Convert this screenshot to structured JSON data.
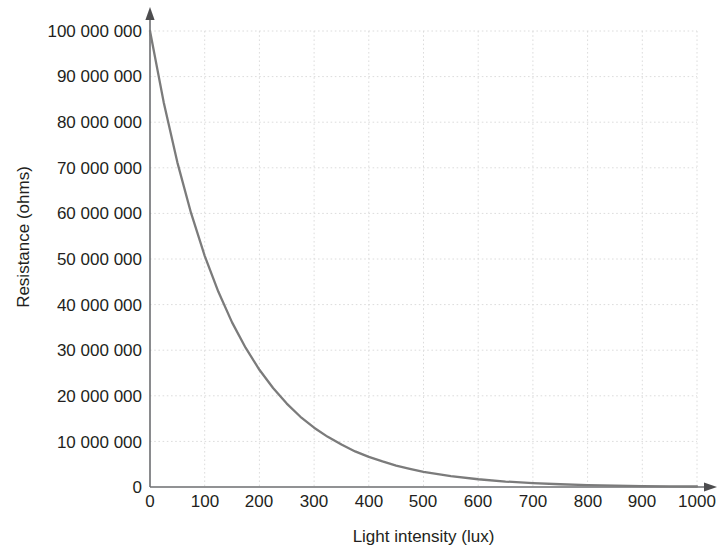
{
  "chart_data": {
    "type": "line",
    "title": "",
    "xlabel": "Light intensity (lux)",
    "ylabel": "Resistance (ohms)",
    "xlim": [
      0,
      1000
    ],
    "ylim": [
      0,
      100000000
    ],
    "grid": true,
    "legend": "none",
    "xticks": [
      0,
      100,
      200,
      300,
      400,
      500,
      600,
      700,
      800,
      900,
      1000
    ],
    "xtick_labels": [
      "0",
      "100",
      "200",
      "300",
      "400",
      "500",
      "600",
      "700",
      "800",
      "900",
      "1000"
    ],
    "yticks": [
      0,
      10000000,
      20000000,
      30000000,
      40000000,
      50000000,
      60000000,
      70000000,
      80000000,
      90000000,
      100000000
    ],
    "ytick_labels": [
      "0",
      "10 000 000",
      "20 000 000",
      "30 000 000",
      "40 000 000",
      "50 000 000",
      "60 000 000",
      "70 000 000",
      "80 000 000",
      "90 000 000",
      "100 000 000"
    ],
    "series": [
      {
        "name": "Resistance vs light intensity",
        "color": "#7b7b7b",
        "x": [
          0,
          25,
          50,
          75,
          100,
          125,
          150,
          175,
          200,
          225,
          250,
          275,
          300,
          325,
          350,
          375,
          400,
          425,
          450,
          475,
          500,
          550,
          600,
          650,
          700,
          750,
          800,
          850,
          900,
          950,
          1000
        ],
        "y": [
          100000000,
          84400000,
          71200000,
          60100000,
          50700000,
          42800000,
          36100000,
          30500000,
          25700000,
          21700000,
          18300000,
          15400000,
          13000000,
          11000000,
          9300000,
          7800000,
          6600000,
          5600000,
          4700000,
          4000000,
          3300000,
          2400000,
          1700000,
          1200000,
          850000,
          600000,
          430000,
          300000,
          210000,
          150000,
          110000
        ],
        "model": "R = 1.0e8 * exp(-0.0068 * L)"
      }
    ],
    "axis_style": {
      "axis_color": "#58595b",
      "grid_color": "#dcdcdc",
      "grid_dash": "dotted",
      "x_axis_arrow": true,
      "y_axis_arrow": true
    }
  }
}
